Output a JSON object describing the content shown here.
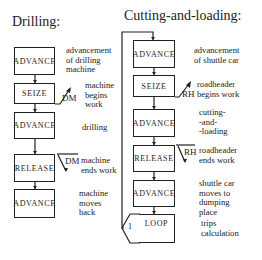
{
  "drilling": {
    "title": "Drilling:",
    "blocks": [
      {
        "label": "ADVANCE",
        "description": "advancement\nof drilling\nmachine"
      },
      {
        "label": "SEIZE",
        "description": "machine\nbegins\nwork",
        "resource": "DM"
      },
      {
        "label": "ADVANCE",
        "description": "drilling"
      },
      {
        "label": "RELEASE",
        "description": "machine\nends work",
        "resource": "DM"
      },
      {
        "label": "ADVANCE",
        "description": "machine\nmoves\nback"
      }
    ]
  },
  "cutting": {
    "title": "Cutting-and-loading:",
    "blocks": [
      {
        "label": "ADVANCE",
        "description": "advancement\nof shuttle car"
      },
      {
        "label": "SEIZE",
        "description": "roadheader\nbegins work",
        "resource": "RH"
      },
      {
        "label": "ADVANCE",
        "description": "cutting-\n-and-\n-loading"
      },
      {
        "label": "RELEASE",
        "description": "roadheader\nends work",
        "resource": "RH"
      },
      {
        "label": "ADVANCE",
        "description": "shuttle car\nmoves to\ndumping\nplace"
      },
      {
        "label": "LOOP",
        "description": "trips\ncalculation",
        "loop_count": "1"
      }
    ]
  }
}
